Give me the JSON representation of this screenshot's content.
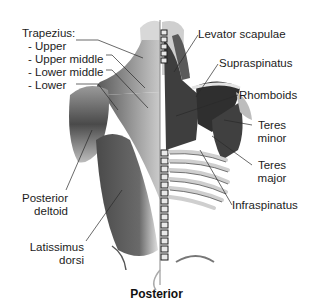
{
  "diagram": {
    "title": "Posterior",
    "view": "posterior back muscles",
    "colors": {
      "muscle_dark": "#3c3c3c",
      "muscle_mid": "#7a7a7a",
      "bone": "#e6e6e6",
      "line": "#2a2a2a",
      "background": "#ffffff"
    },
    "labels": {
      "trapezius_heading": "Trapezius:",
      "trapezius_upper": "- Upper",
      "trapezius_upper_middle": "- Upper middle",
      "trapezius_lower_middle": "- Lower middle",
      "trapezius_lower": "- Lower",
      "levator_scapulae": "Levator scapulae",
      "supraspinatus": "Supraspinatus",
      "rhomboids": "Rhomboids",
      "teres_minor_1": "Teres",
      "teres_minor_2": "minor",
      "teres_major_1": "Teres",
      "teres_major_2": "major",
      "infraspinatus": "Infraspinatus",
      "posterior_deltoid_1": "Posterior",
      "posterior_deltoid_2": "deltoid",
      "latissimus_dorsi_1": "Latissimus",
      "latissimus_dorsi_2": "dorsi"
    }
  }
}
